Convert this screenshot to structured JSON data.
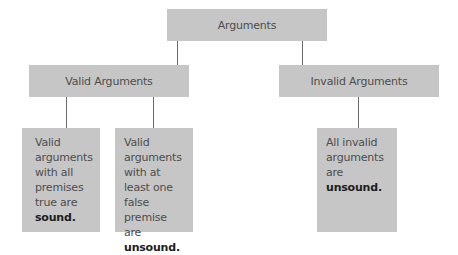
{
  "diagram": {
    "root": {
      "label": "Arguments"
    },
    "branches": [
      {
        "label": "Valid Arguments",
        "leaves": [
          {
            "text": "Valid arguments with all premises true are ",
            "emphasis": "sound",
            "suffix": "."
          },
          {
            "text": "Valid arguments with at least one false premise are ",
            "emphasis": "unsound",
            "suffix": "."
          }
        ]
      },
      {
        "label": "Invalid Arguments",
        "leaves": [
          {
            "text": "All invalid arguments are ",
            "emphasis": "unsound",
            "suffix": "."
          }
        ]
      }
    ]
  },
  "colors": {
    "box_fill": "#c6c6c6",
    "connector": "#6a6a6a",
    "text": "#4d4d4d",
    "emphasis_text": "#1e1e1e"
  }
}
